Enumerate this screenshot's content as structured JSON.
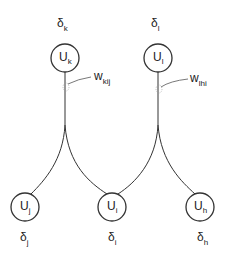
{
  "diagram": {
    "type": "neural-network-backprop",
    "upper_nodes": [
      {
        "id": "k",
        "label": "U",
        "sub": "k",
        "delta": "δ",
        "delta_sub": "k"
      },
      {
        "id": "l",
        "label": "U",
        "sub": "l",
        "delta": "δ",
        "delta_sub": "l"
      }
    ],
    "lower_nodes": [
      {
        "id": "j",
        "label": "U",
        "sub": "j",
        "delta": "δ",
        "delta_sub": "j"
      },
      {
        "id": "i",
        "label": "U",
        "sub": "i",
        "delta": "δ",
        "delta_sub": "i"
      },
      {
        "id": "h",
        "label": "U",
        "sub": "h",
        "delta": "δ",
        "delta_sub": "h"
      }
    ],
    "weights": [
      {
        "label": "w",
        "sub": "kij"
      },
      {
        "label": "w",
        "sub": "lhi"
      }
    ],
    "edges": [
      {
        "from": "k",
        "to": "j"
      },
      {
        "from": "k",
        "to": "i"
      },
      {
        "from": "l",
        "to": "i"
      },
      {
        "from": "l",
        "to": "h"
      }
    ],
    "colors": {
      "stroke": "#333333",
      "text": "#222222",
      "background": "#ffffff"
    }
  }
}
